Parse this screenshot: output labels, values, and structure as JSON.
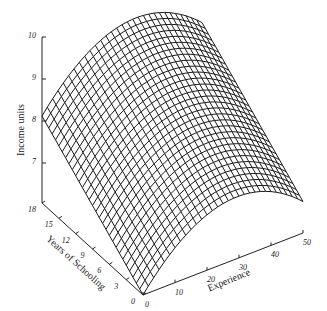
{
  "chart_data": {
    "type": "surface3d",
    "title": "",
    "zlabel": "Income units",
    "xlabel": "Experience",
    "ylabel": "Years of Schooling",
    "z_ticks": [
      "7",
      "8",
      "9",
      "10"
    ],
    "x_ticks": [
      "0",
      "10",
      "20",
      "30",
      "40",
      "50"
    ],
    "y_ticks": [
      "0",
      "3",
      "6",
      "9",
      "12",
      "15",
      "18"
    ],
    "zlim": [
      6,
      10
    ],
    "xlim": [
      0,
      50
    ],
    "ylim": [
      0,
      18
    ],
    "grid": false,
    "legend": null,
    "surface_description": "Wireframe mesh; income increases with schooling (roughly linear) and is concave in experience, peaking around 25-30 years of experience",
    "corner_values": [
      {
        "experience": 0,
        "schooling": 18,
        "income": 8.1
      },
      {
        "experience": 25,
        "schooling": 18,
        "income": 9.9
      },
      {
        "experience": 50,
        "schooling": 18,
        "income": 9.2
      },
      {
        "experience": 50,
        "schooling": 0,
        "income": 7.1
      },
      {
        "experience": 0,
        "schooling": 0,
        "income": 6.0
      }
    ]
  }
}
